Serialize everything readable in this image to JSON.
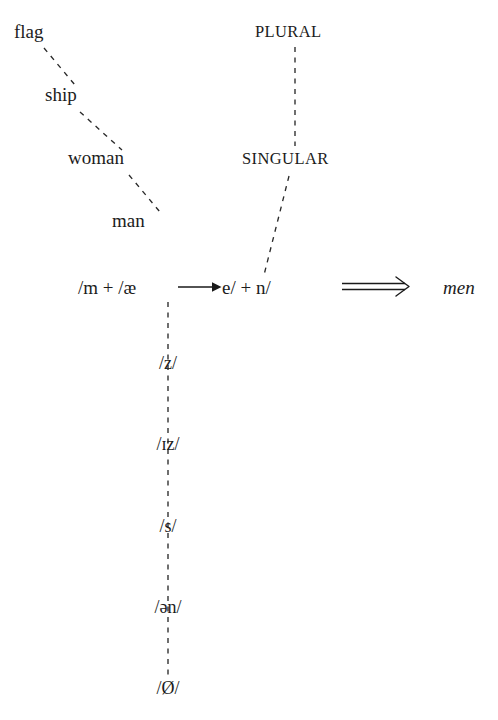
{
  "figure": {
    "background_color": "#ffffff",
    "ink_color": "#1c1c1c"
  },
  "noun_chain": {
    "name": "animacy-hierarchy-chain",
    "items": [
      {
        "label": "flag",
        "x": 14,
        "y": 22
      },
      {
        "label": "ship",
        "x": 45,
        "y": 85
      },
      {
        "label": "woman",
        "x": 68,
        "y": 148
      },
      {
        "label": "man",
        "x": 112,
        "y": 211
      }
    ],
    "connectors": [
      {
        "from": "flag",
        "to": "ship",
        "x1": 44,
        "y1": 48,
        "x2": 75,
        "y2": 85
      },
      {
        "from": "ship",
        "to": "woman",
        "x1": 80,
        "y1": 112,
        "x2": 122,
        "y2": 150
      },
      {
        "from": "woman",
        "to": "man",
        "x1": 129,
        "y1": 175,
        "x2": 160,
        "y2": 212
      }
    ]
  },
  "feature_chain": {
    "name": "number-feature-chain",
    "items": [
      {
        "label": "PLURAL",
        "x": 255,
        "y": 24
      },
      {
        "label": "SINGULAR",
        "x": 242,
        "y": 151
      }
    ],
    "connectors": [
      {
        "from": "PLURAL",
        "to": "SINGULAR",
        "x1": 295,
        "y1": 47,
        "x2": 295,
        "y2": 146
      },
      {
        "from": "SINGULAR",
        "to": "formula",
        "x1": 289,
        "y1": 176,
        "x2": 264,
        "y2": 275
      }
    ]
  },
  "formula": {
    "name": "morphological-rule",
    "left_segment": "/m  +  /æ",
    "right_segment": "e/  + n/",
    "rule_arrow": "single-right-arrow",
    "derivation_arrow": "double-right-arrow",
    "output": "men",
    "left_x": 78,
    "right_x": 222,
    "baseline_y": 292,
    "output_x": 443
  },
  "allomorph_column": {
    "name": "plural-allomorph-paradigm",
    "center_x": 168,
    "items": [
      {
        "label": "/z/",
        "y": 363
      },
      {
        "label": "/ɪz/",
        "y": 444
      },
      {
        "label": "/s/",
        "y": 526
      },
      {
        "label": "/ən/",
        "y": 607
      },
      {
        "label": "/Ø/",
        "y": 688
      }
    ],
    "spine": {
      "x": 168,
      "y_top": 302,
      "y_bottom": 676
    }
  }
}
